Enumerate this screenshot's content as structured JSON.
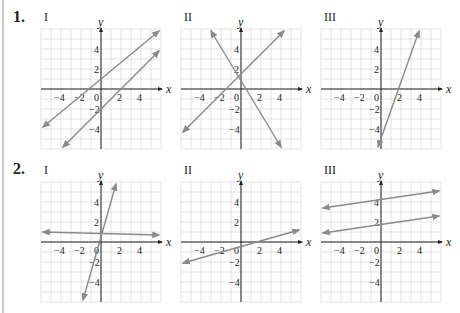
{
  "problems": [
    {
      "number": "1.",
      "graphs": [
        {
          "label": "I",
          "x_axis_label": "x",
          "y_axis_label": "y",
          "lines": [
            {
              "p1": [
                -5.8,
                -3.8
              ],
              "p2": [
                5.8,
                7.8
              ]
            },
            {
              "p1": [
                -3.8,
                -5.8
              ],
              "p2": [
                5.8,
                3.8
              ]
            }
          ]
        },
        {
          "label": "II",
          "x_axis_label": "x",
          "y_axis_label": "y",
          "lines": [
            {
              "p1": [
                -5.8,
                -4.3
              ],
              "p2": [
                4.3,
                5.8
              ]
            },
            {
              "p1": [
                -3.0,
                5.8
              ],
              "p2": [
                4.0,
                -5.8
              ]
            }
          ]
        },
        {
          "label": "III",
          "x_axis_label": "x",
          "y_axis_label": "y",
          "lines": [
            {
              "p1": [
                -0.3,
                -5.8
              ],
              "p2": [
                3.8,
                5.8
              ]
            }
          ]
        }
      ]
    },
    {
      "number": "2.",
      "graphs": [
        {
          "label": "I",
          "x_axis_label": "x",
          "y_axis_label": "y",
          "lines": [
            {
              "p1": [
                -5.8,
                1.0
              ],
              "p2": [
                5.8,
                0.7
              ]
            },
            {
              "p1": [
                -1.8,
                -5.8
              ],
              "p2": [
                1.5,
                5.8
              ]
            }
          ]
        },
        {
          "label": "II",
          "x_axis_label": "x",
          "y_axis_label": "y",
          "lines": [
            {
              "p1": [
                -5.8,
                -2.1
              ],
              "p2": [
                5.8,
                1.2
              ]
            }
          ]
        },
        {
          "label": "III",
          "x_axis_label": "x",
          "y_axis_label": "y",
          "lines": [
            {
              "p1": [
                -5.8,
                3.4
              ],
              "p2": [
                5.8,
                5.1
              ]
            },
            {
              "p1": [
                -5.8,
                0.9
              ],
              "p2": [
                5.8,
                2.6
              ]
            }
          ]
        }
      ]
    }
  ],
  "tick_labels": {
    "x": [
      "−4",
      "−2",
      "0",
      "2",
      "4"
    ],
    "y": [
      "4",
      "2",
      "−2",
      "−4"
    ]
  },
  "colors": {
    "grid": "#dcdcdc",
    "axis": "#231f20",
    "line": "#8a8a8a",
    "text": "#231f20"
  }
}
